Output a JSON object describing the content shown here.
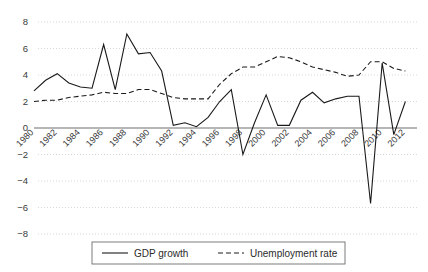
{
  "chart_data": {
    "type": "line",
    "title": "",
    "subtitle": "",
    "xlabel": "",
    "ylabel": "",
    "grid": true,
    "legend_position": "bottom",
    "xlim": [
      1980,
      2013
    ],
    "ylim": [
      -8,
      8
    ],
    "ytick_values": [
      8,
      6,
      4,
      2,
      0,
      -2,
      -4,
      -6,
      -8
    ],
    "ytick_labels": [
      "8",
      "6",
      "4",
      "2",
      "0",
      "−2",
      "−4",
      "−6",
      "−8"
    ],
    "xtick_labels": [
      "1980",
      "1982",
      "1984",
      "1986",
      "1988",
      "1990",
      "1992",
      "1994",
      "1996",
      "1998",
      "2000",
      "2002",
      "2004",
      "2006",
      "2008",
      "2010",
      "2012"
    ],
    "x": [
      1980,
      1981,
      1982,
      1983,
      1984,
      1985,
      1986,
      1987,
      1988,
      1989,
      1990,
      1991,
      1992,
      1993,
      1994,
      1995,
      1996,
      1997,
      1998,
      1999,
      2000,
      2001,
      2002,
      2003,
      2004,
      2005,
      2006,
      2007,
      2008,
      2009,
      2010,
      2011,
      2012
    ],
    "series": [
      {
        "name": "GDP growth",
        "style": "solid",
        "color": "#1a1a1a",
        "values": [
          2.8,
          3.6,
          4.1,
          3.4,
          3.1,
          3.0,
          6.3,
          2.9,
          7.1,
          5.6,
          5.7,
          4.3,
          0.2,
          0.4,
          0.1,
          0.8,
          2.0,
          2.9,
          -2.0,
          0.4,
          2.5,
          0.2,
          0.2,
          2.1,
          2.7,
          1.9,
          2.2,
          2.4,
          2.4,
          -5.7,
          4.9,
          -0.5,
          2.0
        ]
      },
      {
        "name": "Unemployment rate",
        "style": "dashed",
        "color": "#1a1a1a",
        "values": [
          2.0,
          2.1,
          2.1,
          2.3,
          2.4,
          2.5,
          2.7,
          2.6,
          2.6,
          2.9,
          2.9,
          2.6,
          2.3,
          2.2,
          2.2,
          2.2,
          3.3,
          4.1,
          4.6,
          4.6,
          5.0,
          5.4,
          5.3,
          5.0,
          4.6,
          4.4,
          4.2,
          3.9,
          4.0,
          5.0,
          5.0,
          4.5,
          4.3
        ]
      }
    ]
  },
  "legend": {
    "items": [
      {
        "label": "GDP growth",
        "style": "solid"
      },
      {
        "label": "Unemployment rate",
        "style": "dashed"
      }
    ]
  }
}
